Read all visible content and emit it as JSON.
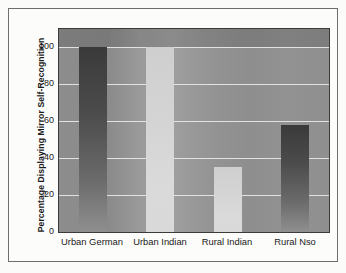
{
  "chart_data": {
    "type": "bar",
    "title": "",
    "xlabel": "",
    "ylabel": "Percentage Displaying Mirror Self-Recognition",
    "categories": [
      "Urban German",
      "Urban Indian",
      "Rural Indian",
      "Rural Nso"
    ],
    "values": [
      100,
      100,
      35,
      58
    ],
    "ylim": [
      0,
      110
    ],
    "yticks": [
      0,
      20,
      40,
      60,
      80,
      100
    ],
    "ytick_labels": [
      "0",
      "20",
      "40",
      "60",
      "80",
      "100"
    ],
    "grid": true,
    "legend": false,
    "bar_styles": [
      "dark",
      "light",
      "light",
      "dark"
    ],
    "colors": {
      "bar_dark": "#4b4b4b",
      "bar_light": "#d6d6d6",
      "plot_background": "#939393",
      "gridline": "#e2e2e2",
      "axis": "#3b3b3b",
      "text": "#1a1a1a",
      "page_background": "#fbfbfa",
      "frame": "#6e6e6e"
    }
  }
}
